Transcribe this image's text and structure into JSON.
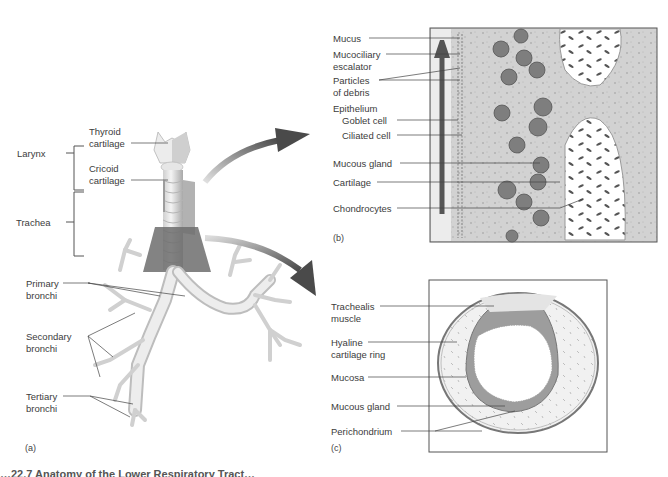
{
  "figure": {
    "caption_visible_fragment": "…22.7 Anatomy of the Lower Respiratory Tract…",
    "colors": {
      "label_text": "#3c3c3c",
      "leader_line": "#444444",
      "arrow": "#5a5a5a",
      "cartilage_light": "#e8e8e8",
      "tissue_grey": "#bdbdbd",
      "frame": "#555555"
    }
  },
  "panel_a": {
    "tag": "(a)",
    "brackets": {
      "larynx": "Larynx",
      "trachea": "Trachea"
    },
    "labels": {
      "thyroid_l1": "Thyroid",
      "thyroid_l2": "cartilage",
      "cricoid_l1": "Cricoid",
      "cricoid_l2": "cartilage",
      "primary_l1": "Primary",
      "primary_l2": "bronchi",
      "secondary_l1": "Secondary",
      "secondary_l2": "bronchi",
      "tertiary_l1": "Tertiary",
      "tertiary_l2": "bronchi"
    }
  },
  "panel_b": {
    "tag": "(b)",
    "labels": {
      "mucus": "Mucus",
      "mucociliary_l1": "Mucociliary",
      "mucociliary_l2": "escalator",
      "particles_l1": "Particles",
      "particles_l2": "of debris",
      "epithelium": "Epithelium",
      "goblet": "Goblet cell",
      "ciliated": "Ciliated cell",
      "mucous_gland": "Mucous gland",
      "cartilage": "Cartilage",
      "chondrocytes": "Chondrocytes"
    }
  },
  "panel_c": {
    "tag": "(c)",
    "labels": {
      "trachealis_l1": "Trachealis",
      "trachealis_l2": "muscle",
      "hyaline_l1": "Hyaline",
      "hyaline_l2": "cartilage ring",
      "mucosa": "Mucosa",
      "mucous_gland": "Mucous gland",
      "perichondrium": "Perichondrium"
    }
  }
}
